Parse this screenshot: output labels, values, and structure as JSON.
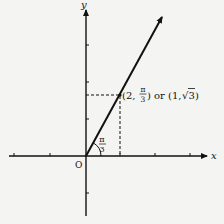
{
  "diagram": {
    "axes": {
      "x_label": "x",
      "y_label": "y",
      "origin_label": "O"
    },
    "angle_label": {
      "numerator": "π",
      "denominator": "3"
    },
    "point_label": {
      "prefix": "(2, ",
      "frac_num": "π",
      "frac_den": "3",
      "middle": ") or (1, ",
      "sqrt_sign": "√",
      "radicand": "3",
      "suffix": ")"
    },
    "colors": {
      "ink": "#111111",
      "background": "#f4f4f2"
    }
  }
}
